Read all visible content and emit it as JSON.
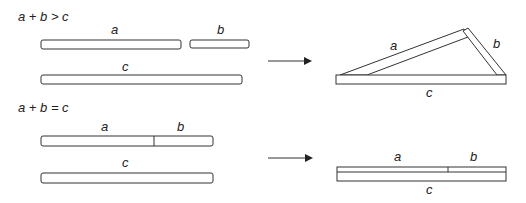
{
  "diagram": {
    "case1": {
      "condition": "a + b > c",
      "labels": {
        "a": "a",
        "b": "b",
        "c": "c"
      },
      "result": "triangle formed"
    },
    "case2": {
      "condition": "a + b = c",
      "labels": {
        "a": "a",
        "b": "b",
        "c": "c"
      },
      "result": "segments collapse onto a line"
    },
    "colors": {
      "stroke": "#333333",
      "fill": "#ffffff",
      "text": "#222222"
    }
  }
}
